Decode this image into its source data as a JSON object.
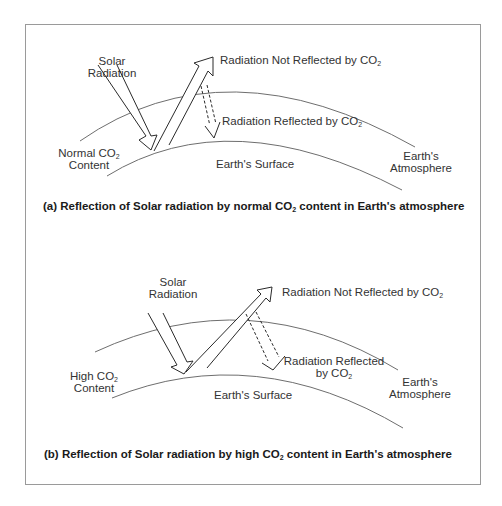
{
  "figure": {
    "panels": [
      {
        "id": "a",
        "labels": {
          "solar_radiation_1": "Solar",
          "solar_radiation_2": "Radiation",
          "not_reflected": "Radiation Not Reflected by CO",
          "not_reflected_sub": "2",
          "reflected": "Radiation Reflected by CO",
          "reflected_sub": "2",
          "co2_content_1": "Normal CO",
          "co2_content_sub": "2",
          "co2_content_2": "Content",
          "surface": "Earth's Surface",
          "atmosphere_1": "Earth's",
          "atmosphere_2": "Atmosphere"
        },
        "caption_pre": "(a) Reflection of Solar radiation by normal CO",
        "caption_sub": "2",
        "caption_post": " content in Earth's atmosphere"
      },
      {
        "id": "b",
        "labels": {
          "solar_radiation_1": "Solar",
          "solar_radiation_2": "Radiation",
          "not_reflected": "Radiation Not Reflected by CO",
          "not_reflected_sub": "2",
          "reflected_1": "Radiation Reflected",
          "reflected_2": "by CO",
          "reflected_sub": "2",
          "co2_content_1": "High CO",
          "co2_content_sub": "2",
          "co2_content_2": "Content",
          "surface": "Earth's Surface",
          "atmosphere_1": "Earth's",
          "atmosphere_2": "Atmosphere"
        },
        "caption_pre": "(b) Reflection of Solar radiation by high CO",
        "caption_sub": "2",
        "caption_post": " content in Earth's atmosphere"
      }
    ],
    "colors": {
      "line": "#2a2a2a",
      "curve": "#6e6e6e",
      "frame": "#9a9a9a"
    }
  }
}
